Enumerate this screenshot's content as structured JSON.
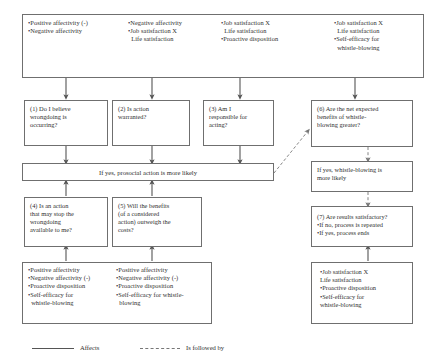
{
  "diagram": {
    "antecedents_row": {
      "name": "antecedents",
      "cells": [
        {
          "id": "ant-1",
          "lines": [
            "•Positive affectivity (-)",
            "•Negative affectivity"
          ]
        },
        {
          "id": "ant-2",
          "lines": [
            "•Negative affectivity",
            "•Job satisfaction X",
            "Life satisfaction"
          ]
        },
        {
          "id": "ant-3",
          "lines": [
            "•Job satisfaction X",
            "Life satisfaction",
            "•Proactive disposition"
          ]
        },
        {
          "id": "ant-4",
          "lines": [
            "•Job satisfaction X",
            "Life satisfaction",
            "•Self-efficacy for",
            "whistle-blowing"
          ]
        }
      ]
    },
    "questions_row": {
      "q1": {
        "lines": [
          "(1) Do I believe",
          "wrongdoing is",
          "occurring?"
        ]
      },
      "q2": {
        "lines": [
          "(2) Is action",
          "warranted?"
        ]
      },
      "q3": {
        "lines": [
          "(3) Am I",
          "responsible for",
          "acting?"
        ]
      },
      "q6": {
        "lines": [
          "(6) Are the net expected",
          "benefits of whistle-",
          "blowing greater?"
        ]
      }
    },
    "prosocial_band": {
      "text": "If yes, prosocial  action is more likely"
    },
    "whistle_band": {
      "lines": [
        "If yes, whistle-blowing is",
        "more likely"
      ]
    },
    "lower_questions": {
      "q4": {
        "lines": [
          "(4) Is an action",
          "that may stop the",
          "wrongdoing",
          "available to me?"
        ]
      },
      "q5": {
        "lines": [
          "(5) Will the benefits",
          "(of a considered",
          "action) outweigh the",
          "costs?"
        ]
      },
      "q7": {
        "lines": [
          "(7) Are results satisfactory?",
          "•If no, process is repeated",
          "•If yes, process ends"
        ]
      }
    },
    "lower_antecedents": {
      "cells": [
        {
          "id": "lant-1",
          "lines": [
            "•Positive affectivity",
            "•Negative affectivity (-)",
            "•Proactive disposition",
            "•Self-efficacy for",
            "whistle-blowing"
          ]
        },
        {
          "id": "lant-2",
          "lines": [
            "•Positive affectivity",
            "•Negative affectivity (-)",
            "•Proactive disposition",
            "•Self-efficacy for whistle-",
            "blowing"
          ]
        }
      ]
    },
    "right_antecedent": {
      "lines": [
        "•Job satisfaction X",
        "Life satisfaction",
        "•Proactive disposition",
        "•Self-efficacy for",
        "whistle-blowing"
      ]
    },
    "legend": {
      "affects_label": "Affects",
      "followed_by_label": "Is followed by"
    },
    "colors": {
      "border": "#6f6f6f",
      "text": "#2f2f2f",
      "arrow_solid": "#555555",
      "arrow_dashed": "#777777",
      "background": "#ffffff"
    }
  }
}
